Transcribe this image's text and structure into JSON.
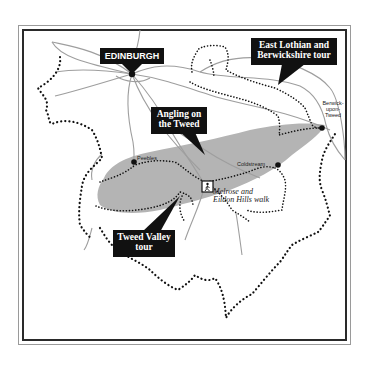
{
  "map": {
    "colors": {
      "tweed_area": "#b4b4b4",
      "roads": "#9e9e9e",
      "routes": "#111111",
      "label_bg": "#111111",
      "label_text": "#ffffff",
      "frame_outer": "#9a9a9a",
      "frame_inner": "#2a2a2a"
    },
    "callouts": {
      "edinburgh": "EDINBURGH",
      "east_lothian_line1": "East Lothian and",
      "east_lothian_line2": "Berwickshire tour",
      "angling_line1": "Angling on",
      "angling_line2": "the Tweed",
      "tweed_valley_line1": "Tweed Valley",
      "tweed_valley_line2": "tour"
    },
    "towns": {
      "peebles": "Peebles",
      "coldstream": "Coldstream",
      "berwick_line1": "Berwick-",
      "berwick_line2": "upon-",
      "berwick_line3": "Tweed"
    },
    "walk": {
      "line1": "Melrose and",
      "line2": "Eildon Hills walk",
      "icon": "hiker-icon"
    }
  }
}
